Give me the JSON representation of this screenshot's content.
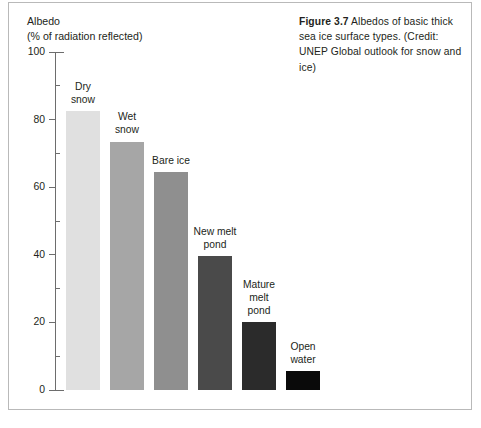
{
  "figure": {
    "caption_label": "Figure 3.7",
    "caption_text": " Albedos of basic thick sea ice surface types. (Credit: UNEP Global outlook for snow and ice)"
  },
  "axis": {
    "title_line1": "Albedo",
    "title_line2": "(% of radiation reflected)"
  },
  "chart_data": {
    "type": "bar",
    "title": "Albedos of basic thick sea ice surface types",
    "xlabel": "",
    "ylabel": "Albedo (% of radiation reflected)",
    "ylim": [
      0,
      100
    ],
    "ytick_labels": [
      "0",
      "20",
      "40",
      "60",
      "80",
      "100"
    ],
    "ytick_values": [
      0,
      20,
      40,
      60,
      80,
      100
    ],
    "yminor_values": [
      10,
      30,
      50,
      70,
      90
    ],
    "grid": false,
    "legend": "none",
    "categories": [
      "Dry snow",
      "Wet snow",
      "Bare ice",
      "New melt pond",
      "Mature melt pond",
      "Open water"
    ],
    "category_lines": [
      [
        "Dry",
        "snow"
      ],
      [
        "Wet",
        "snow"
      ],
      [
        "Bare ice"
      ],
      [
        "New melt",
        "pond"
      ],
      [
        "Mature",
        "melt",
        "pond"
      ],
      [
        "Open",
        "water"
      ]
    ],
    "values": [
      82.5,
      73.5,
      64.5,
      39.5,
      20,
      5.5
    ],
    "colors": [
      "#e0e0e0",
      "#a6a6a6",
      "#8f8f8f",
      "#4a4a4a",
      "#2b2b2b",
      "#0a0a0a"
    ]
  }
}
